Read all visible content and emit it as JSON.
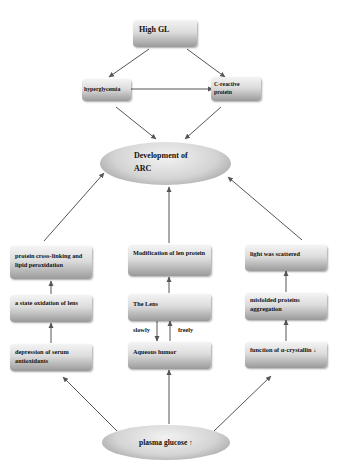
{
  "diagram": {
    "nodes": {
      "high_gl": "High GL",
      "hyperglycemia": "hyperglycemia",
      "c_reactive_protein": "C-reactive protein",
      "development_arc_line1": "Development of",
      "development_arc_line2": "ARC",
      "protein_crosslinking": "protein cross-linking and lipid peroxidation",
      "state_oxidation": "a state oxidation of lens",
      "depression_antioxidants": "depression of serum antioxidants",
      "modification_lens_protein": "Modification of len protein",
      "the_lens": "The Lens",
      "aqueous_humor": "Aqueous humor",
      "light_scattered": "light was scattered",
      "misfolded_proteins": "misfolded proteins aggregation",
      "function_crystallin": "function of α-crystallin ↓",
      "plasma_glucose": "plasma glucose ↑"
    },
    "edge_labels": {
      "slowly": "slowly",
      "freely": "freely"
    },
    "edges": [
      {
        "from": "high_gl",
        "to": "hyperglycemia"
      },
      {
        "from": "high_gl",
        "to": "c_reactive_protein"
      },
      {
        "from": "hyperglycemia",
        "to": "c_reactive_protein"
      },
      {
        "from": "hyperglycemia",
        "to": "development_arc"
      },
      {
        "from": "c_reactive_protein",
        "to": "development_arc"
      },
      {
        "from": "protein_crosslinking",
        "to": "development_arc"
      },
      {
        "from": "modification_lens_protein",
        "to": "development_arc"
      },
      {
        "from": "light_scattered",
        "to": "development_arc"
      },
      {
        "from": "state_oxidation",
        "to": "protein_crosslinking"
      },
      {
        "from": "depression_antioxidants",
        "to": "state_oxidation"
      },
      {
        "from": "the_lens",
        "to": "modification_lens_protein"
      },
      {
        "from": "the_lens",
        "to": "aqueous_humor",
        "label": "slowly"
      },
      {
        "from": "aqueous_humor",
        "to": "the_lens",
        "label": "freely"
      },
      {
        "from": "misfolded_proteins",
        "to": "light_scattered"
      },
      {
        "from": "function_crystallin",
        "to": "misfolded_proteins"
      },
      {
        "from": "plasma_glucose",
        "to": "depression_antioxidants"
      },
      {
        "from": "plasma_glucose",
        "to": "aqueous_humor"
      },
      {
        "from": "plasma_glucose",
        "to": "function_crystallin"
      }
    ],
    "colors": {
      "box_top": "#f4f4f4",
      "box_bottom": "#9a9a9a",
      "arrow": "#555555",
      "text": "#111111"
    }
  }
}
